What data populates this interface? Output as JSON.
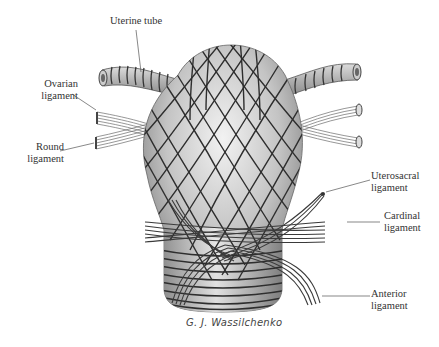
{
  "figure": {
    "type": "anatomical illustration",
    "colors": {
      "background": "#ffffff",
      "organ_light": "#e6e6e6",
      "organ_dark": "#8a8a8a",
      "fiber_line": "#2e2e2e",
      "label_text": "#333333",
      "leader_line": "#555555"
    }
  },
  "labels": {
    "uterine_tube": "Uterine tube",
    "ovarian_ligament_1": "Ovarian",
    "ovarian_ligament_2": "ligament",
    "round_ligament_1": "Round",
    "round_ligament_2": "ligament",
    "uterosacral_ligament_1": "Uterosacral",
    "uterosacral_ligament_2": "ligament",
    "cardinal_ligament_1": "Cardinal",
    "cardinal_ligament_2": "ligament",
    "anterior_ligament_1": "Anterior",
    "anterior_ligament_2": "ligament"
  },
  "signature": "G. J. Wassilchenko"
}
